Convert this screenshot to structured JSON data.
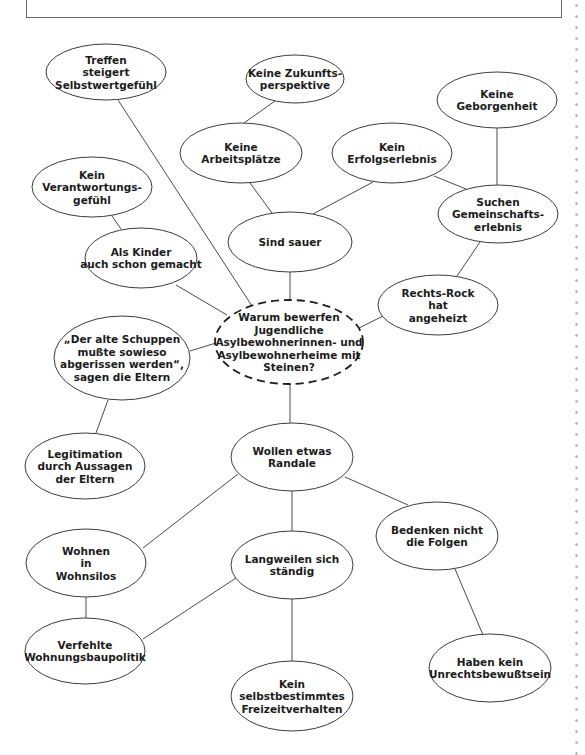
{
  "diagram": {
    "type": "mind-map",
    "central_question": {
      "id": "center",
      "lines": [
        "Warum bewerfen",
        "Jugendliche",
        "Asylbewohnerinnen- und",
        "Asylbewohnerheime mit",
        "Steinen?"
      ],
      "cx": 289,
      "cy": 342,
      "rx": 74,
      "ry": 42,
      "dashed": true
    },
    "nodes": [
      {
        "id": "treffen",
        "lines": [
          "Treffen",
          "steigert",
          "Selbstwertgefühl"
        ],
        "cx": 106,
        "cy": 72,
        "rx": 60,
        "ry": 28
      },
      {
        "id": "zukunft",
        "lines": [
          "Keine Zukunfts-",
          "perspektive"
        ],
        "cx": 295,
        "cy": 79,
        "rx": 49,
        "ry": 24
      },
      {
        "id": "geborgenheit",
        "lines": [
          "Keine",
          "Geborgenheit"
        ],
        "cx": 497,
        "cy": 100,
        "rx": 60,
        "ry": 28
      },
      {
        "id": "arbeitsplaetze",
        "lines": [
          "Keine",
          "Arbeitsplätze"
        ],
        "cx": 241,
        "cy": 153,
        "rx": 61,
        "ry": 30
      },
      {
        "id": "erfolgserlebnis",
        "lines": [
          "Kein",
          "Erfolgserlebnis"
        ],
        "cx": 392,
        "cy": 153,
        "rx": 60,
        "ry": 30
      },
      {
        "id": "verantwortung",
        "lines": [
          "Kein",
          "Verantwortungs-",
          "gefühl"
        ],
        "cx": 92,
        "cy": 187,
        "rx": 60,
        "ry": 30
      },
      {
        "id": "gemeinschaft",
        "lines": [
          "Suchen",
          "Gemeinschafts-",
          "erlebnis"
        ],
        "cx": 498,
        "cy": 214,
        "rx": 60,
        "ry": 29
      },
      {
        "id": "sauer",
        "lines": [
          "Sind sauer"
        ],
        "cx": 290,
        "cy": 242,
        "rx": 62,
        "ry": 30
      },
      {
        "id": "kinder",
        "lines": [
          "Als Kinder",
          "auch schon gemacht"
        ],
        "cx": 141,
        "cy": 258,
        "rx": 56,
        "ry": 30
      },
      {
        "id": "rechtsrock",
        "lines": [
          "Rechts-Rock",
          "hat",
          "angeheizt"
        ],
        "cx": 438,
        "cy": 305,
        "rx": 60,
        "ry": 30
      },
      {
        "id": "schuppen",
        "lines": [
          "„Der alte Schuppen",
          "mußte sowieso",
          "abgerissen werden“,",
          "sagen die Eltern"
        ],
        "cx": 122,
        "cy": 358,
        "rx": 68,
        "ry": 42
      },
      {
        "id": "legitimation",
        "lines": [
          "Legitimation",
          "durch Aussagen",
          "der Eltern"
        ],
        "cx": 85,
        "cy": 466,
        "rx": 60,
        "ry": 33
      },
      {
        "id": "randale",
        "lines": [
          "Wollen etwas",
          "Randale"
        ],
        "cx": 292,
        "cy": 457,
        "rx": 61,
        "ry": 34
      },
      {
        "id": "bedenken",
        "lines": [
          "Bedenken nicht",
          "die Folgen"
        ],
        "cx": 437,
        "cy": 536,
        "rx": 61,
        "ry": 34
      },
      {
        "id": "wohnsilos",
        "lines": [
          "Wohnen",
          "in",
          "Wohnsilos"
        ],
        "cx": 86,
        "cy": 563,
        "rx": 60,
        "ry": 34
      },
      {
        "id": "langweilen",
        "lines": [
          "Langweilen sich",
          "ständig"
        ],
        "cx": 292,
        "cy": 565,
        "rx": 61,
        "ry": 34
      },
      {
        "id": "wohnungsbau",
        "lines": [
          "Verfehlte",
          "Wohnungsbaupolitik"
        ],
        "cx": 85,
        "cy": 651,
        "rx": 60,
        "ry": 33
      },
      {
        "id": "unrecht",
        "lines": [
          "Haben kein",
          "Unrechtsbewußtsein"
        ],
        "cx": 490,
        "cy": 668,
        "rx": 61,
        "ry": 34
      },
      {
        "id": "freizeit",
        "lines": [
          "Kein",
          "selbstbestimmtes",
          "Freizeitverhalten"
        ],
        "cx": 292,
        "cy": 696,
        "rx": 61,
        "ry": 35
      }
    ],
    "edges": [
      {
        "from": "treffen",
        "to": "center",
        "x1": 118,
        "y1": 100,
        "x2": 252,
        "y2": 306
      },
      {
        "from": "zukunft",
        "to": "arbeitsplaetze",
        "x1": 275,
        "y1": 101,
        "x2": 244,
        "y2": 123
      },
      {
        "from": "arbeitsplaetze",
        "to": "sauer",
        "x1": 250,
        "y1": 183,
        "x2": 272,
        "y2": 213
      },
      {
        "from": "erfolgserlebnis",
        "to": "sauer",
        "x1": 373,
        "y1": 182,
        "x2": 313,
        "y2": 214
      },
      {
        "from": "erfolgserlebnis",
        "to": "gemeinschaft",
        "x1": 434,
        "y1": 176,
        "x2": 466,
        "y2": 189
      },
      {
        "from": "geborgenheit",
        "to": "gemeinschaft",
        "x1": 497,
        "y1": 128,
        "x2": 497,
        "y2": 185
      },
      {
        "from": "gemeinschaft",
        "to": "rechtsrock",
        "x1": 480,
        "y1": 242,
        "x2": 457,
        "y2": 276
      },
      {
        "from": "verantwortung",
        "to": "kinder",
        "x1": 112,
        "y1": 216,
        "x2": 121,
        "y2": 229
      },
      {
        "from": "kinder",
        "to": "center",
        "x1": 176,
        "y1": 285,
        "x2": 227,
        "y2": 315
      },
      {
        "from": "sauer",
        "to": "center",
        "x1": 290,
        "y1": 272,
        "x2": 290,
        "y2": 300
      },
      {
        "from": "rechtsrock",
        "to": "center",
        "x1": 383,
        "y1": 316,
        "x2": 359,
        "y2": 328
      },
      {
        "from": "schuppen",
        "to": "center",
        "x1": 190,
        "y1": 351,
        "x2": 216,
        "y2": 343
      },
      {
        "from": "schuppen",
        "to": "legitimation",
        "x1": 108,
        "y1": 400,
        "x2": 96,
        "y2": 433
      },
      {
        "from": "center",
        "to": "randale",
        "x1": 290,
        "y1": 384,
        "x2": 290,
        "y2": 423
      },
      {
        "from": "randale",
        "to": "wohnsilos",
        "x1": 238,
        "y1": 474,
        "x2": 143,
        "y2": 548
      },
      {
        "from": "randale",
        "to": "langweilen",
        "x1": 292,
        "y1": 491,
        "x2": 292,
        "y2": 531
      },
      {
        "from": "randale",
        "to": "bedenken",
        "x1": 345,
        "y1": 477,
        "x2": 408,
        "y2": 505
      },
      {
        "from": "wohnsilos",
        "to": "wohnungsbau",
        "x1": 86,
        "y1": 597,
        "x2": 86,
        "y2": 618
      },
      {
        "from": "langweilen",
        "to": "wohnungsbau",
        "x1": 236,
        "y1": 578,
        "x2": 143,
        "y2": 639
      },
      {
        "from": "langweilen",
        "to": "freizeit",
        "x1": 292,
        "y1": 599,
        "x2": 292,
        "y2": 661
      },
      {
        "from": "bedenken",
        "to": "unrecht",
        "x1": 455,
        "y1": 569,
        "x2": 483,
        "y2": 635
      }
    ]
  }
}
